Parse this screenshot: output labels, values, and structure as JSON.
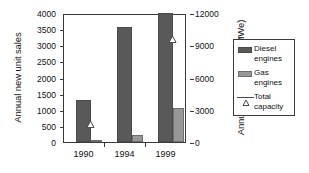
{
  "chart_data": {
    "type": "bar",
    "title": "",
    "categories": [
      "1990",
      "1994",
      "1999"
    ],
    "xlabel": "",
    "ylabel": "Annual new unit sales",
    "ylabel_right": "Annual new capacity (MWe)",
    "ylim": [
      0,
      4000
    ],
    "ylim_right": [
      0,
      12000
    ],
    "yticks": [
      0,
      500,
      1000,
      1500,
      2000,
      2500,
      3000,
      3500,
      4000
    ],
    "yticks_right": [
      0,
      3000,
      6000,
      9000,
      12000
    ],
    "ytick_labels": [
      "0",
      "500",
      "1000",
      "1500",
      "2000",
      "2500",
      "3000",
      "3500",
      "4000"
    ],
    "ytick_labels_right": [
      "0",
      "3000",
      "6000",
      "9000",
      "12000"
    ],
    "grid": false,
    "legend_position": "right-outside",
    "series": [
      {
        "name": "Diesel engines",
        "type": "bar",
        "axis": "left",
        "unit": "units",
        "color": "#595959",
        "values": [
          1300,
          3560,
          4000
        ]
      },
      {
        "name": "Gas engines",
        "type": "bar",
        "axis": "left",
        "unit": "units",
        "color": "#979797",
        "values": [
          70,
          230,
          1060
        ]
      },
      {
        "name": "Total capacity",
        "type": "marker",
        "axis": "right",
        "unit": "MWe",
        "marker": "open-triangle",
        "color": "#4a4a4a",
        "values": [
          1850,
          null,
          9700
        ]
      }
    ],
    "legend": [
      {
        "label_line1": "Diesel",
        "label_line2": "engines",
        "key": "swatch-dark"
      },
      {
        "label_line1": "Gas",
        "label_line2": "engines",
        "key": "swatch-light"
      },
      {
        "label_line1": "Total",
        "label_line2": "capacity",
        "key": "line-triangle"
      }
    ]
  }
}
